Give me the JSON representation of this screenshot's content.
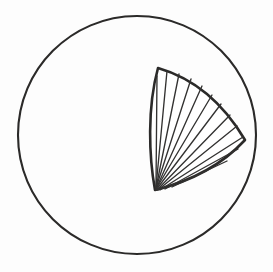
{
  "figure": {
    "background_color": "#fdfdfd",
    "ink_color": "#2b2a29",
    "hatch_color": "#333231",
    "style": "hand-drawn scanned line art",
    "canvas": {
      "width": 273,
      "height": 272
    }
  },
  "shapes": {
    "outer_circle": {
      "label": "outer-circle",
      "center_x": 137,
      "center_y": 135,
      "radius": 119,
      "stroke_width": 2.1,
      "filled": false
    },
    "hatched_region": {
      "label": "hatched-curvilinear-triangle",
      "stroke_width": 2.6,
      "fill": "#ffffff",
      "vertices": [
        {
          "name": "top-apex",
          "x": 158,
          "y": 68
        },
        {
          "name": "right-point",
          "x": 245,
          "y": 140
        },
        {
          "name": "bottom-point",
          "x": 155,
          "y": 190
        }
      ],
      "path": "M 158 68 C 196 79 225 106 245 140 C 219 168 184 183 155 190 C 149 157 147 108 158 68 Z",
      "edges": [
        {
          "name": "upper-right-edge",
          "curvature": "convex"
        },
        {
          "name": "lower-right-edge",
          "curvature": "concave"
        },
        {
          "name": "left-edge",
          "curvature": "slightly-concave-bulging-left"
        }
      ]
    },
    "hatching": {
      "label": "fan-hatch",
      "pattern": "fan",
      "origin_x": 155,
      "origin_y": 190,
      "line_count": 12,
      "stroke_width": 1.35,
      "lines": [
        {
          "x1": 156,
          "y1": 186,
          "x2": 157,
          "y2": 76
        },
        {
          "x1": 156,
          "y1": 187,
          "x2": 167,
          "y2": 71
        },
        {
          "x1": 156,
          "y1": 188,
          "x2": 179,
          "y2": 74
        },
        {
          "x1": 156,
          "y1": 188,
          "x2": 191,
          "y2": 79
        },
        {
          "x1": 156,
          "y1": 189,
          "x2": 202,
          "y2": 86
        },
        {
          "x1": 156,
          "y1": 189,
          "x2": 212,
          "y2": 95
        },
        {
          "x1": 156,
          "y1": 190,
          "x2": 221,
          "y2": 104
        },
        {
          "x1": 157,
          "y1": 190,
          "x2": 230,
          "y2": 115
        },
        {
          "x1": 158,
          "y1": 190,
          "x2": 237,
          "y2": 126
        },
        {
          "x1": 160,
          "y1": 190,
          "x2": 243,
          "y2": 137
        },
        {
          "x1": 165,
          "y1": 189,
          "x2": 238,
          "y2": 149
        },
        {
          "x1": 172,
          "y1": 187,
          "x2": 227,
          "y2": 161
        }
      ]
    }
  }
}
